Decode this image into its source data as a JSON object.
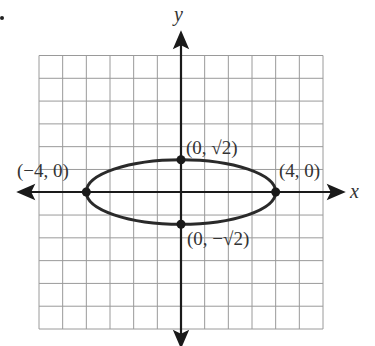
{
  "chart_data": {
    "type": "scatter",
    "title": "",
    "xlabel": "x",
    "ylabel": "y",
    "xlim": [
      -6,
      6
    ],
    "ylim": [
      -6,
      6
    ],
    "grid": true,
    "curve": {
      "type": "ellipse",
      "center": [
        0,
        0
      ],
      "semi_major_x": 4,
      "semi_minor_y": 1.41421356
    },
    "points": [
      {
        "x": 0,
        "y": 1.41421356,
        "label": "(0, √2)"
      },
      {
        "x": -4,
        "y": 0,
        "label": "(−4, 0)"
      },
      {
        "x": 4,
        "y": 0,
        "label": "(4, 0)"
      },
      {
        "x": 0,
        "y": -1.41421356,
        "label": "(0, −√2)"
      }
    ],
    "colors": {
      "grid": "#9a9a9a",
      "axes": "#1a1a1a",
      "curve": "#2a2a2a"
    }
  },
  "labels": {
    "x_axis": "x",
    "y_axis": "y",
    "top_vertex": "(0, √2)",
    "bottom_vertex": "(0, −√2)",
    "left_vertex": "(−4, 0)",
    "right_vertex": "(4, 0)"
  }
}
